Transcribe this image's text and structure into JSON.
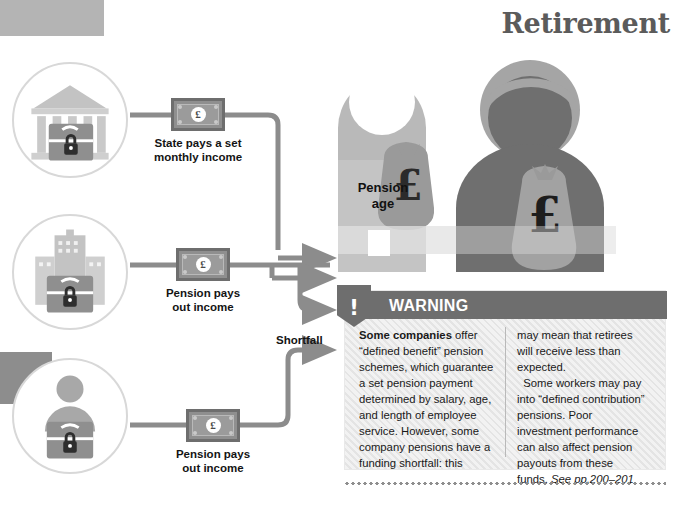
{
  "page": {
    "title": "Retirement"
  },
  "sources": [
    {
      "icon": "government-building-lock-icon",
      "note_currency": "£",
      "label": "State pays a set\nmonthly income",
      "label_line1": "State pays a set",
      "label_line2": "monthly income"
    },
    {
      "icon": "office-building-briefcase-lock-icon",
      "note_currency": "£",
      "label": "Pension pays\nout income",
      "label_line1": "Pension pays",
      "label_line2": "out income"
    },
    {
      "icon": "person-briefcase-lock-icon",
      "note_currency": "£",
      "label": "Pension pays\nout income",
      "label_line1": "Pension pays",
      "label_line2": "out income"
    }
  ],
  "flow": {
    "shortfall_label": "Shortfall"
  },
  "figures": {
    "pension_age_label_line1": "Pension",
    "pension_age_label_line2": "age",
    "money_bag_symbol": "£"
  },
  "warning": {
    "icon": "exclamation-warning-icon",
    "title": "WARNING",
    "column_left_html": "<b>Some companies</b> offer “defined benefit” pension schemes, which guarantee a set pension payment determined by salary, age, and length of employee service. However, some company pensions have a funding shortfall: this",
    "column_right_html": "may mean that retirees will receive less than expected.<br>&nbsp;&nbsp;Some workers may pay into “defined contribution” pensions. Poor investment performance can also affect pension payouts from these funds. <i>See pp.200–201</i>"
  },
  "colors": {
    "title_gray": "#5b5b5b",
    "warning_header_gray": "#6e6e6e",
    "wire_gray": "#8c8c8c",
    "figure_dark": "#6f6f6f",
    "figure_light": "#b8b8b8",
    "note_border": "#6e6e6e"
  }
}
